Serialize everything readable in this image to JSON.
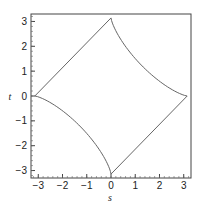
{
  "chart_data": {
    "type": "line",
    "title": "",
    "xlabel": "s",
    "ylabel": "t",
    "xlim": [
      -3.3,
      3.3
    ],
    "ylim": [
      -3.3,
      3.3
    ],
    "grid": false,
    "xticks": [
      -3,
      -2,
      -1,
      0,
      1,
      2,
      3
    ],
    "yticks": [
      -3,
      -2,
      -1,
      0,
      1,
      2,
      3
    ],
    "xtick_labels": [
      "−3",
      "−2",
      "−1",
      "0",
      "1",
      "2",
      "3"
    ],
    "ytick_labels": [
      "−3",
      "−2",
      "−1",
      "0",
      "1",
      "2",
      "3"
    ],
    "series": [
      {
        "name": "closed curve",
        "color": "#555555",
        "description": "Closed curve: straight edges in quadrants II and IV, concave (inward-curving) edges in quadrants I and III",
        "vertices": [
          [
            0,
            3.14
          ],
          [
            3.14,
            0
          ],
          [
            0,
            -3.14
          ],
          [
            -3.14,
            0
          ]
        ]
      }
    ]
  }
}
